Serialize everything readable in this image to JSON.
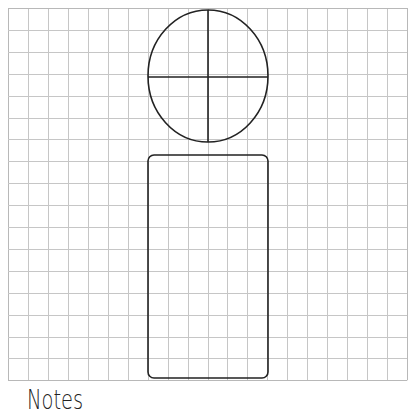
{
  "grid": {
    "left": 8,
    "top": 8,
    "columns": 20,
    "rows": 17,
    "cell_width": 19.95,
    "cell_height": 21.9,
    "line_color": "#c6c6c6",
    "border_color": "#b8b8b8"
  },
  "shapes": {
    "head_circle": {
      "cx": 208,
      "cy": 76,
      "rx": 60,
      "ry": 66,
      "stroke": "#222222"
    },
    "head_horizontal_line": {
      "x1": 148,
      "y1": 77,
      "x2": 268,
      "y2": 77
    },
    "head_vertical_line": {
      "x1": 208,
      "y1": 10,
      "x2": 208,
      "y2": 142
    },
    "body_rect": {
      "x": 148,
      "y": 155,
      "width": 120,
      "height": 223,
      "radius": 6,
      "stroke": "#222222"
    }
  },
  "labels": {
    "notes": "Notes"
  }
}
